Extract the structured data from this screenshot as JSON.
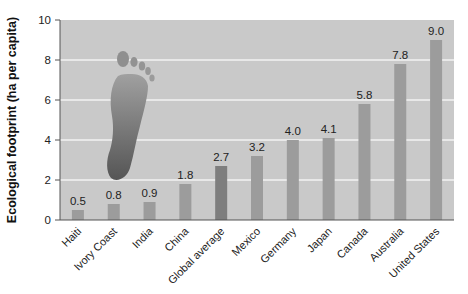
{
  "chart_data": {
    "type": "bar",
    "title": "",
    "xlabel": "",
    "ylabel": "Ecological footprint (ha per capita)",
    "ylim": [
      0,
      10
    ],
    "yticks": [
      0,
      2,
      4,
      6,
      8,
      10
    ],
    "grid": true,
    "legend": null,
    "categories": [
      "Haiti",
      "Ivory Coast",
      "India",
      "China",
      "Global average",
      "Mexico",
      "Germany",
      "Japan",
      "Canada",
      "Australia",
      "United States"
    ],
    "values": [
      0.5,
      0.8,
      0.9,
      1.8,
      2.7,
      3.2,
      4.0,
      4.1,
      5.8,
      7.8,
      9.0
    ],
    "value_labels": [
      "0.5",
      "0.8",
      "0.9",
      "1.8",
      "2.7",
      "3.2",
      "4.0",
      "4.1",
      "5.8",
      "7.8",
      "9.0"
    ],
    "highlighted_category": "Global average",
    "annotations": [
      "footprint-illustration"
    ]
  },
  "colors": {
    "plot_background": "#c9c9c9",
    "gridline": "#f2f2f2",
    "bar": "#9c9c9c",
    "bar_highlight": "#7e7e7e",
    "axis": "#555555",
    "text": "#222222",
    "footprint_top": "#9a9a9a",
    "footprint_bottom": "#555555"
  }
}
